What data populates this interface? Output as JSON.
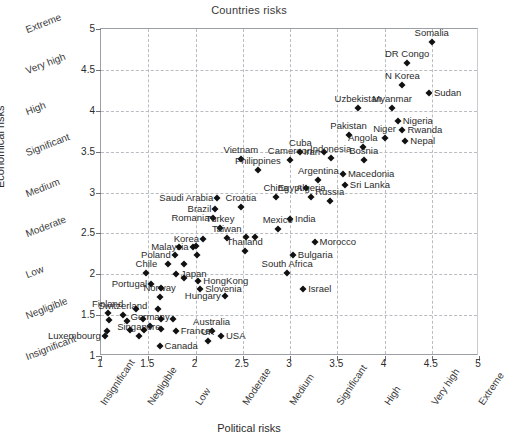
{
  "chart_data": {
    "type": "scatter",
    "title": "Countries risks",
    "xlabel": "Political risks",
    "ylabel": "Economical risks",
    "xlim": [
      1,
      5
    ],
    "ylim": [
      1,
      5
    ],
    "grid": true,
    "legend": "none",
    "x_ticks": [
      "1",
      "1.5",
      "2",
      "2.5",
      "3",
      "3.5",
      "4",
      "4.5",
      "5"
    ],
    "y_ticks": [
      "1",
      "1.5",
      "2",
      "2.5",
      "3",
      "3.5",
      "4",
      "4.5",
      "5"
    ],
    "x_categories": [
      "Insignificant",
      "Negligible",
      "Low",
      "Moderate",
      "Medium",
      "Significant",
      "High",
      "Very high",
      "Extreme"
    ],
    "y_categories": [
      "Insignificant",
      "Negligible",
      "Low",
      "Moderate",
      "Medium",
      "Significant",
      "High",
      "Very high",
      "Extreme"
    ],
    "points": [
      {
        "label": "Somalia",
        "x": 4.5,
        "y": 4.84,
        "lp": "ct"
      },
      {
        "label": "DR Congo",
        "x": 4.24,
        "y": 4.59,
        "lp": "ct"
      },
      {
        "label": "N Korea",
        "x": 4.19,
        "y": 4.32,
        "lp": "ct"
      },
      {
        "label": "Sudan",
        "x": 4.47,
        "y": 4.22,
        "lp": "lr"
      },
      {
        "label": "Myanmar",
        "x": 4.08,
        "y": 4.03,
        "lp": "ct"
      },
      {
        "label": "Uzbekistan",
        "x": 3.72,
        "y": 4.03,
        "lp": "ct"
      },
      {
        "label": "Nigeria",
        "x": 4.14,
        "y": 3.88,
        "lp": "lr"
      },
      {
        "label": "Rwanda",
        "x": 4.19,
        "y": 3.76,
        "lp": "lr"
      },
      {
        "label": "Nepal",
        "x": 4.22,
        "y": 3.63,
        "lp": "lr"
      },
      {
        "label": "Niger",
        "x": 4.0,
        "y": 3.67,
        "lp": "ct"
      },
      {
        "label": "Pakistan",
        "x": 3.62,
        "y": 3.7,
        "lp": "ct"
      },
      {
        "label": "Angola",
        "x": 3.77,
        "y": 3.56,
        "lp": "ct"
      },
      {
        "label": "Bosnia",
        "x": 3.78,
        "y": 3.4,
        "lp": "ct"
      },
      {
        "label": "Macedonia",
        "x": 3.56,
        "y": 3.23,
        "lp": "lr"
      },
      {
        "label": "Sri Lanka",
        "x": 3.58,
        "y": 3.09,
        "lp": "lr"
      },
      {
        "label": "Iran",
        "x": 3.36,
        "y": 3.49,
        "lp": "rl"
      },
      {
        "label": "Indonesia",
        "x": 3.43,
        "y": 3.42,
        "lp": "ct"
      },
      {
        "label": "Cuba",
        "x": 3.11,
        "y": 3.5,
        "lp": "ct"
      },
      {
        "label": "Cameroon",
        "x": 3.0,
        "y": 3.4,
        "lp": "ct"
      },
      {
        "label": "Vietnam",
        "x": 2.48,
        "y": 3.41,
        "lp": "ct"
      },
      {
        "label": "Philippines",
        "x": 2.66,
        "y": 3.27,
        "lp": "ct"
      },
      {
        "label": "Argentina",
        "x": 3.3,
        "y": 3.15,
        "lp": "ct"
      },
      {
        "label": "Egypt",
        "x": 3.17,
        "y": 3.06,
        "lp": "rl"
      },
      {
        "label": "Algeria",
        "x": 3.22,
        "y": 2.95,
        "lp": "ct"
      },
      {
        "label": "Russia",
        "x": 3.42,
        "y": 2.9,
        "lp": "ct"
      },
      {
        "label": "China",
        "x": 2.85,
        "y": 2.95,
        "lp": "ct"
      },
      {
        "label": "Saudi Arabia",
        "x": 2.23,
        "y": 2.93,
        "lp": "rl"
      },
      {
        "label": "Croatia",
        "x": 2.48,
        "y": 2.82,
        "lp": "ct"
      },
      {
        "label": "Brazil",
        "x": 2.21,
        "y": 2.8,
        "lp": "rl"
      },
      {
        "label": "Romania",
        "x": 2.19,
        "y": 2.69,
        "lp": "rl"
      },
      {
        "label": "India",
        "x": 3.0,
        "y": 2.68,
        "lp": "lr"
      },
      {
        "label": "Mexico",
        "x": 2.87,
        "y": 2.55,
        "lp": "ct"
      },
      {
        "label": "Turkey",
        "x": 2.26,
        "y": 2.56,
        "lp": "ct"
      },
      {
        "label": "Korea",
        "x": 2.08,
        "y": 2.43,
        "lp": "rl"
      },
      {
        "label": "Taiwan",
        "x": 2.33,
        "y": 2.44,
        "lp": "ct"
      },
      {
        "label": "Morocco",
        "x": 3.26,
        "y": 2.4,
        "lp": "lr"
      },
      {
        "label": "Malaysia",
        "x": 1.97,
        "y": 2.33,
        "lp": "rl"
      },
      {
        "label": "Thailand",
        "x": 2.52,
        "y": 2.29,
        "lp": "ct"
      },
      {
        "label": "Poland",
        "x": 1.78,
        "y": 2.23,
        "lp": "rl"
      },
      {
        "label": "Bulgaria",
        "x": 3.03,
        "y": 2.23,
        "lp": "lr"
      },
      {
        "label": "Chile",
        "x": 1.48,
        "y": 2.02,
        "lp": "ct"
      },
      {
        "label": "Japan",
        "x": 1.79,
        "y": 2.0,
        "lp": "lr"
      },
      {
        "label": "South Africa",
        "x": 2.97,
        "y": 2.02,
        "lp": "ct"
      },
      {
        "label": "HongKong",
        "x": 2.03,
        "y": 1.92,
        "lp": "lr"
      },
      {
        "label": "Slovenia",
        "x": 2.05,
        "y": 1.82,
        "lp": "lr"
      },
      {
        "label": "Portugal",
        "x": 1.53,
        "y": 1.88,
        "lp": "rl"
      },
      {
        "label": "Israel",
        "x": 3.14,
        "y": 1.82,
        "lp": "lr"
      },
      {
        "label": "Hungary",
        "x": 2.31,
        "y": 1.73,
        "lp": "rl"
      },
      {
        "label": "Norway",
        "x": 1.62,
        "y": 1.72,
        "lp": "ct"
      },
      {
        "label": "Finland",
        "x": 1.07,
        "y": 1.52,
        "lp": "ct"
      },
      {
        "label": "Switzerland",
        "x": 1.23,
        "y": 1.5,
        "lp": "ct"
      },
      {
        "label": "Germany",
        "x": 1.52,
        "y": 1.37,
        "lp": "ct"
      },
      {
        "label": "France",
        "x": 1.79,
        "y": 1.31,
        "lp": "lr"
      },
      {
        "label": "Singapore",
        "x": 1.4,
        "y": 1.25,
        "lp": "ct"
      },
      {
        "label": "Luxembourg",
        "x": 1.04,
        "y": 1.24,
        "lp": "rl"
      },
      {
        "label": "Australia",
        "x": 2.17,
        "y": 1.3,
        "lp": "ct"
      },
      {
        "label": "UK",
        "x": 2.13,
        "y": 1.18,
        "lp": "ct"
      },
      {
        "label": "USA",
        "x": 2.27,
        "y": 1.25,
        "lp": "lr"
      },
      {
        "label": "Canada",
        "x": 1.62,
        "y": 1.12,
        "lp": "lr"
      }
    ],
    "extra_points": [
      {
        "x": 1.08,
        "y": 1.44
      },
      {
        "x": 1.06,
        "y": 1.3
      },
      {
        "x": 1.28,
        "y": 1.43
      },
      {
        "x": 1.31,
        "y": 1.32
      },
      {
        "x": 1.44,
        "y": 1.45
      },
      {
        "x": 1.63,
        "y": 1.45
      },
      {
        "x": 1.76,
        "y": 1.45
      },
      {
        "x": 1.45,
        "y": 1.32
      },
      {
        "x": 1.63,
        "y": 1.33
      },
      {
        "x": 1.6,
        "y": 1.58
      },
      {
        "x": 1.37,
        "y": 1.58
      },
      {
        "x": 1.64,
        "y": 1.83
      },
      {
        "x": 1.88,
        "y": 1.95
      },
      {
        "x": 1.88,
        "y": 2.12
      },
      {
        "x": 1.71,
        "y": 2.12
      },
      {
        "x": 2.02,
        "y": 2.24
      },
      {
        "x": 2.01,
        "y": 2.35
      },
      {
        "x": 1.83,
        "y": 2.33
      },
      {
        "x": 2.53,
        "y": 2.46
      },
      {
        "x": 2.63,
        "y": 2.45
      }
    ]
  }
}
